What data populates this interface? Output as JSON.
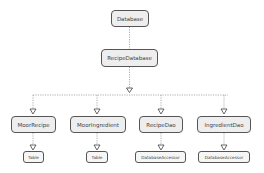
{
  "diagram": {
    "type": "tree",
    "colors": {
      "node_fill": "#eeeeee",
      "node_border": "#555555",
      "edge": "#999999",
      "text": "#444444"
    },
    "root": {
      "id": "database",
      "label": "Database"
    },
    "level1": {
      "id": "recipe-database",
      "label": "RecipeDatabase"
    },
    "level2": [
      {
        "id": "moor-recipe",
        "label": "MoorRecipe",
        "child": {
          "label": "Table"
        }
      },
      {
        "id": "moor-ingredient",
        "label": "MoorIngredient",
        "child": {
          "label": "Table"
        }
      },
      {
        "id": "recipe-dao",
        "label": "RecipeDao",
        "child": {
          "label": "DatabaseAccessor"
        }
      },
      {
        "id": "ingredient-dao",
        "label": "IngredientDao",
        "child": {
          "label": "DatabaseAccessor"
        }
      }
    ],
    "edges": [
      [
        "Database",
        "RecipeDatabase"
      ],
      [
        "RecipeDatabase",
        "MoorRecipe"
      ],
      [
        "RecipeDatabase",
        "MoorIngredient"
      ],
      [
        "RecipeDatabase",
        "RecipeDao"
      ],
      [
        "RecipeDatabase",
        "IngredientDao"
      ],
      [
        "MoorRecipe",
        "Table"
      ],
      [
        "MoorIngredient",
        "Table"
      ],
      [
        "RecipeDao",
        "DatabaseAccessor"
      ],
      [
        "IngredientDao",
        "DatabaseAccessor"
      ]
    ]
  }
}
